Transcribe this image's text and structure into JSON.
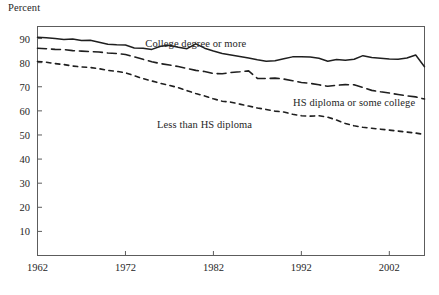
{
  "chart_data": {
    "type": "line",
    "title": "",
    "subtitle": "",
    "xlabel": "",
    "ylabel": "Percent",
    "xlim": [
      1962,
      2006
    ],
    "ylim": [
      0,
      95
    ],
    "grid": false,
    "legend_position": "inline-annotations",
    "xticks": [
      1962,
      1972,
      1982,
      1992,
      2002
    ],
    "xtick_labels": [
      "1962",
      "1972",
      "1982",
      "1992",
      "2002"
    ],
    "yticks": [
      10,
      20,
      30,
      40,
      50,
      60,
      70,
      80,
      90
    ],
    "ytick_labels": [
      "10",
      "20",
      "30",
      "40",
      "50",
      "60",
      "70",
      "80",
      "90"
    ],
    "x": [
      1962,
      1963,
      1964,
      1965,
      1966,
      1967,
      1968,
      1969,
      1970,
      1971,
      1972,
      1973,
      1974,
      1975,
      1976,
      1977,
      1978,
      1979,
      1980,
      1981,
      1982,
      1983,
      1984,
      1985,
      1986,
      1987,
      1988,
      1989,
      1990,
      1991,
      1992,
      1993,
      1994,
      1995,
      1996,
      1997,
      1998,
      1999,
      2000,
      2001,
      2002,
      2003,
      2004,
      2005,
      2006
    ],
    "series": [
      {
        "name": "College degree or more",
        "style": "solid",
        "values": [
          90.5,
          90.3,
          90.0,
          89.6,
          89.8,
          89.2,
          89.3,
          88.5,
          87.6,
          87.4,
          87.3,
          86.1,
          86.0,
          85.5,
          86.8,
          87.2,
          86.4,
          85.8,
          87.8,
          86.0,
          84.8,
          83.8,
          83.2,
          82.6,
          81.9,
          81.2,
          80.6,
          80.8,
          81.6,
          82.4,
          82.5,
          82.3,
          81.8,
          80.6,
          81.3,
          81.0,
          81.4,
          82.9,
          82.1,
          81.8,
          81.5,
          81.4,
          81.9,
          83.2,
          78.3
        ]
      },
      {
        "name": "HS diploma or some college",
        "style": "dashed",
        "values": [
          86.0,
          85.8,
          85.5,
          85.4,
          85.0,
          84.8,
          84.6,
          84.4,
          84.0,
          83.8,
          83.4,
          82.4,
          81.4,
          80.4,
          79.6,
          79.0,
          78.4,
          77.6,
          76.8,
          76.3,
          75.5,
          75.4,
          75.9,
          76.2,
          76.6,
          73.5,
          73.4,
          73.6,
          73.2,
          72.5,
          71.8,
          71.4,
          70.8,
          70.2,
          70.6,
          70.9,
          70.8,
          69.7,
          68.5,
          67.9,
          67.4,
          66.8,
          66.2,
          65.8,
          64.9
        ]
      },
      {
        "name": "Less than HS diploma",
        "style": "dotted",
        "values": [
          80.5,
          80.2,
          79.6,
          79.2,
          78.6,
          78.2,
          78.0,
          77.5,
          76.8,
          76.4,
          75.8,
          74.6,
          73.4,
          72.4,
          71.4,
          70.6,
          69.6,
          68.4,
          67.2,
          66.2,
          65.0,
          64.0,
          63.6,
          62.8,
          62.0,
          61.2,
          60.6,
          59.9,
          59.5,
          58.6,
          58.0,
          57.8,
          58.0,
          57.4,
          56.2,
          54.8,
          53.8,
          53.2,
          52.8,
          52.4,
          52.0,
          51.6,
          51.2,
          50.8,
          50.2
        ]
      }
    ],
    "annotations": [
      {
        "text": "College degree or more",
        "x": 1980,
        "y": 88.0
      },
      {
        "text": "HS diploma or some college",
        "x": 1998,
        "y": 63.5
      },
      {
        "text": "Less than HS diploma",
        "x": 1981,
        "y": 54.5
      }
    ]
  }
}
